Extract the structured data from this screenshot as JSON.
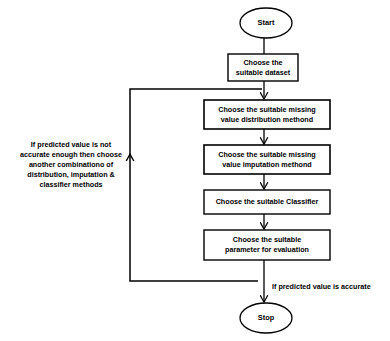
{
  "diagram": {
    "type": "flowchart",
    "background_color": "#ffffff",
    "stroke_color": "#000000",
    "text_color": "#000000",
    "nodes": [
      {
        "id": "start",
        "shape": "ellipse",
        "label": "Start",
        "x": 240,
        "y": 8,
        "width": 52,
        "height": 30
      },
      {
        "id": "choose-dataset",
        "shape": "rectangle",
        "label": "Choose the\nsuitable dataset",
        "x": 228,
        "y": 54,
        "width": 70,
        "height": 27
      },
      {
        "id": "choose-distribution",
        "shape": "rectangle",
        "label": "Choose the suitable missing\nvalue distribution methond",
        "x": 204,
        "y": 100,
        "width": 126,
        "height": 29
      },
      {
        "id": "choose-imputation",
        "shape": "rectangle",
        "label": "Choose the suitable missing\nvalue  imputation  methond",
        "x": 204,
        "y": 145,
        "width": 126,
        "height": 29
      },
      {
        "id": "choose-classifier",
        "shape": "rectangle",
        "label": "Choose the suitable Classifier",
        "x": 204,
        "y": 190,
        "width": 126,
        "height": 24
      },
      {
        "id": "choose-parameter",
        "shape": "rectangle",
        "label": "Choose the suitable\nparameter for evaluation",
        "x": 204,
        "y": 230,
        "width": 126,
        "height": 30
      },
      {
        "id": "stop",
        "shape": "ellipse",
        "label": "Stop",
        "x": 240,
        "y": 303,
        "width": 52,
        "height": 30
      }
    ],
    "annotations": [
      {
        "id": "feedback-note",
        "text": "If predicted value is not\naccurate enough then choose\nanother combinationo of\ndistribution, imputation &\nclassifier methods",
        "x": 6,
        "y": 140,
        "width": 130
      },
      {
        "id": "accurate-note",
        "text": "If predicted value is accurate",
        "x": 272,
        "y": 282,
        "width": 116
      }
    ],
    "edges": [
      {
        "id": "start-to-dataset",
        "from": "start",
        "to": "choose-dataset",
        "arrow": true
      },
      {
        "id": "dataset-to-distribution",
        "from": "choose-dataset",
        "to": "choose-distribution",
        "arrow": true
      },
      {
        "id": "distribution-to-imputation",
        "from": "choose-distribution",
        "to": "choose-imputation",
        "arrow": true
      },
      {
        "id": "imputation-to-classifier",
        "from": "choose-imputation",
        "to": "choose-classifier",
        "arrow": true
      },
      {
        "id": "classifier-to-parameter",
        "from": "choose-parameter",
        "to": "choose-parameter",
        "arrow": true
      },
      {
        "id": "parameter-to-stop",
        "from": "choose-parameter",
        "to": "stop",
        "arrow": true
      },
      {
        "id": "feedback-loop",
        "from": "choose-parameter",
        "to": "choose-distribution",
        "arrow": true,
        "style": "orthogonal-left"
      }
    ]
  }
}
